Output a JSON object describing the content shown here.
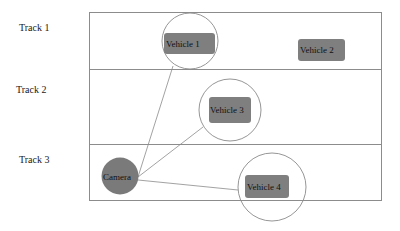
{
  "tracks": [
    {
      "label": "Track 1"
    },
    {
      "label": "Track 2"
    },
    {
      "label": "Track 3"
    }
  ],
  "camera": {
    "label": "Camera"
  },
  "vehicles": [
    {
      "label": "Vehicle 1",
      "in_range": true,
      "track": 1
    },
    {
      "label": "Vehicle 2",
      "in_range": false,
      "track": 1
    },
    {
      "label": "Vehicle 3",
      "in_range": true,
      "track": 2
    },
    {
      "label": "Vehicle 4",
      "in_range": true,
      "track": 3
    }
  ],
  "colors": {
    "lane_border": "#8c8c8c",
    "vehicle_fill": "#7f7f7f",
    "camera_fill": "#7a7a7a",
    "range_circle": "#8a8a8a",
    "link_line": "#8a8a8a"
  }
}
